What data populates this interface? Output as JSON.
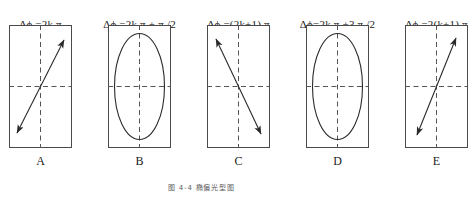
{
  "figure": {
    "caption": "图 4-4  椭偏光型图",
    "panel_width": 63,
    "panel_height": 123
  },
  "panels": [
    {
      "id": "A",
      "label": "A",
      "left": 9,
      "formula_parts": {
        "delta": "Δ",
        "phi": "ϕ",
        "rest": " =2k π"
      },
      "formula_text": "Δϕ =2k π",
      "shape": "line",
      "description": "linear-polarization-positive-slope"
    },
    {
      "id": "B",
      "label": "B",
      "left": 108,
      "formula_parts": {
        "delta": "Δ",
        "phi": "ϕ",
        "rest": " =2k π + π /2"
      },
      "formula_text": "Δϕ =2k π + π /2",
      "shape": "ellipse",
      "description": "elliptical-polarization-upright"
    },
    {
      "id": "C",
      "label": "C",
      "left": 207,
      "formula_parts": {
        "delta": "Δ",
        "phi": "ϕ",
        "rest": " =(2k+1) π"
      },
      "formula_text": "Δϕ =(2k+1) π",
      "shape": "line",
      "description": "linear-polarization-negative-slope"
    },
    {
      "id": "D",
      "label": "D",
      "left": 306,
      "formula_parts": {
        "delta": "Δ",
        "phi": "ϕ",
        "rest": "=2k π +3 π /2"
      },
      "formula_text": "Δϕ=2k π +3 π /2",
      "shape": "ellipse",
      "description": "elliptical-polarization-upright"
    },
    {
      "id": "E",
      "label": "E",
      "left": 405,
      "formula_parts": {
        "delta": "Δ",
        "phi": "ϕ",
        "rest": " =2(k+1) π"
      },
      "formula_text": "Δϕ =2(k+1) π",
      "shape": "line",
      "description": "linear-polarization-positive-slope-steep"
    }
  ],
  "colors": {
    "frame": "#4a4a4a",
    "axis_dashed": "#555555",
    "curve": "#2b2b2b",
    "text": "#1a1a1a"
  }
}
